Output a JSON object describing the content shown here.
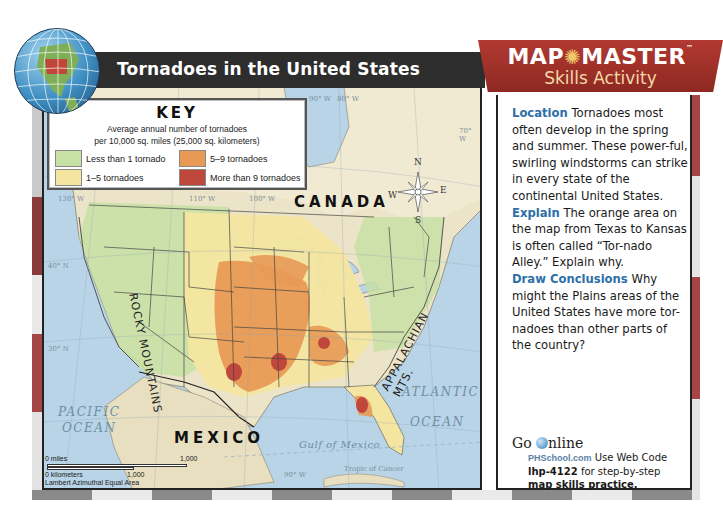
{
  "title": "Tornadoes in the United States",
  "key": {
    "heading": "KEY",
    "subtitle_line1": "Average annual number of tornadoes",
    "subtitle_line2": "per 10,000 sq. miles (25,000 sq. kilometers)",
    "items": [
      {
        "label": "Less than 1 tornado",
        "color": "#c7e0a4"
      },
      {
        "label": "1–5 tornadoes",
        "color": "#f4e6a0"
      },
      {
        "label": "5–9 tornadoes",
        "color": "#e89a55"
      },
      {
        "label": "More than 9 tornadoes",
        "color": "#c0473b"
      }
    ]
  },
  "map_labels": {
    "canada": "CANADA",
    "mexico": "MEXICO",
    "pacific_1": "PACIFIC",
    "pacific_2": "OCEAN",
    "atlantic_1": "ATLANTIC",
    "atlantic_2": "OCEAN",
    "gulf": "Gulf of Mexico",
    "rockies": "ROCKY MOUNTAINS",
    "appalachian": "APPALACHIAN MTS.",
    "tropic": "Tropic of Cancer",
    "grid": [
      "130° W",
      "110° W",
      "100° W",
      "90° W",
      "80° W",
      "70° W",
      "40° N",
      "30° N",
      "90° W"
    ],
    "compass": {
      "n": "N",
      "s": "S",
      "e": "E",
      "w": "W"
    }
  },
  "scale": {
    "miles_label": "0 miles",
    "miles_value": "1,000",
    "km_label": "0 kilometers",
    "km_value": "1,000",
    "projection": "Lambert Azimuthal Equal Area"
  },
  "sidebar": {
    "header_title": "MAP",
    "header_title2": "MASTER",
    "tm": "™",
    "header_subtitle": "Skills Activity",
    "location_kw": "Location",
    "location_text": "Tornadoes most often develop in the spring and summer. These power-ful, swirling windstorms can strike in every state of the continental United States.",
    "explain_kw": "Explain",
    "explain_text": "The orange area on the map from Texas to Kansas is often called “Tor-nado Alley.” Explain why.",
    "conclude_kw": "Draw Conclusions",
    "conclude_text": "Why might the Plains areas of the United States have more tor-nadoes than other parts of the country?",
    "go_online_1": "Go",
    "go_online_2": "nline",
    "phschool": "PHSchool.com",
    "web_text": "Use Web Code",
    "web_code": "lhp-4122",
    "web_text2": "for step-by-step",
    "web_text3": "map skills practice."
  },
  "colors": {
    "title_bar": "#2d2d2d",
    "header_red": "#b23a32",
    "keyword_blue": "#2d6fa8"
  }
}
